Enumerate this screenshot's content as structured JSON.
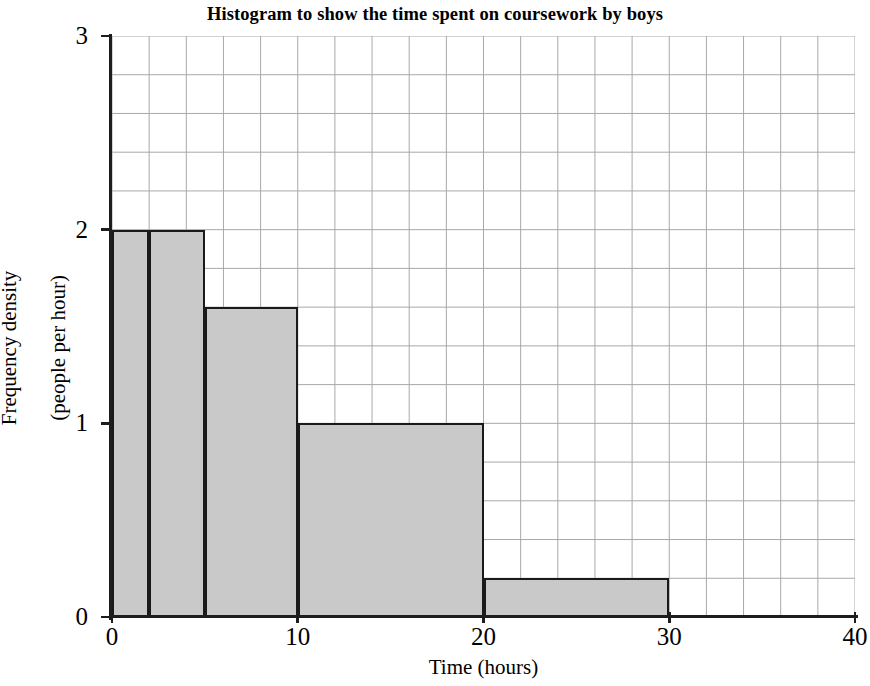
{
  "chart_data": {
    "type": "bar",
    "title": "Histogram to show the time spent on coursework by boys",
    "xlabel": "Time (hours)",
    "ylabel_line1": "Frequency density",
    "ylabel_line2": "(people per hour)",
    "xlim": [
      0,
      40
    ],
    "ylim": [
      0,
      3
    ],
    "grid": true,
    "grid_x_step": 2,
    "grid_y_step": 0.2,
    "legend": null,
    "x_tick_labels": [
      "0",
      "10",
      "20",
      "30",
      "40"
    ],
    "x_tick_values": [
      0,
      10,
      20,
      30,
      40
    ],
    "y_tick_labels": [
      "0",
      "1",
      "2",
      "3"
    ],
    "y_tick_values": [
      0,
      1,
      2,
      3
    ],
    "bins": [
      {
        "label": "0-2",
        "x0": 0,
        "x1": 2,
        "density": 2.0,
        "frequency": 4
      },
      {
        "label": "2-5",
        "x0": 2,
        "x1": 5,
        "density": 2.0,
        "frequency": 6
      },
      {
        "label": "5-10",
        "x0": 5,
        "x1": 10,
        "density": 1.6,
        "frequency": 8
      },
      {
        "label": "10-20",
        "x0": 10,
        "x1": 20,
        "density": 1.0,
        "frequency": 10
      },
      {
        "label": "20-30",
        "x0": 20,
        "x1": 30,
        "density": 0.2,
        "frequency": 2
      }
    ],
    "bar_fill_color": "#c9c9c9",
    "bar_edge_color": "#1a1a1a",
    "grid_color": "#a8a8a8",
    "axis_color": "#1d1d1d"
  }
}
